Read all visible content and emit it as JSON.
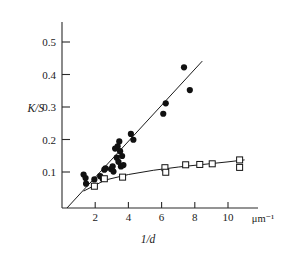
{
  "chart_data": {
    "type": "scatter",
    "title": "",
    "subtitle": "",
    "xlabel": "1/d",
    "ylabel": "K/S",
    "x_unit": "μm⁻¹",
    "xlim": [
      0,
      11.6
    ],
    "ylim": [
      0,
      0.56
    ],
    "grid": false,
    "legend_position": "none",
    "x_ticks": [
      2,
      4,
      6,
      8,
      10
    ],
    "x_tick_labels": [
      "2",
      "4",
      "6",
      "8",
      "10"
    ],
    "y_ticks": [
      0.1,
      0.2,
      0.3,
      0.4,
      0.5
    ],
    "y_tick_labels": [
      "0.1",
      "0.2",
      "0.3",
      "0.4",
      "0.5"
    ],
    "series": [
      {
        "name": "filled-circles",
        "marker": "circle-filled",
        "color": "#111111",
        "points": [
          [
            1.3,
            0.103
          ],
          [
            1.42,
            0.092
          ],
          [
            1.45,
            0.075
          ],
          [
            1.95,
            0.088
          ],
          [
            2.3,
            0.098
          ],
          [
            2.45,
            0.09
          ],
          [
            2.55,
            0.118
          ],
          [
            2.62,
            0.122
          ],
          [
            2.95,
            0.12
          ],
          [
            3.05,
            0.128
          ],
          [
            3.1,
            0.112
          ],
          [
            3.2,
            0.183
          ],
          [
            3.3,
            0.155
          ],
          [
            3.35,
            0.19
          ],
          [
            3.4,
            0.142
          ],
          [
            3.45,
            0.205
          ],
          [
            3.5,
            0.175
          ],
          [
            3.55,
            0.128
          ],
          [
            3.62,
            0.16
          ],
          [
            3.7,
            0.132
          ],
          [
            4.15,
            0.228
          ],
          [
            4.3,
            0.21
          ],
          [
            6.1,
            0.29
          ],
          [
            6.25,
            0.322
          ],
          [
            7.35,
            0.433
          ],
          [
            7.7,
            0.363
          ]
        ],
        "fit": {
          "type": "linear",
          "x0": 0.3,
          "y0": 0.0,
          "x1": 8.45,
          "y1": 0.452
        }
      },
      {
        "name": "open-squares",
        "marker": "square-open",
        "color": "#111111",
        "points": [
          [
            1.95,
            0.067
          ],
          [
            2.55,
            0.09
          ],
          [
            3.65,
            0.095
          ],
          [
            6.2,
            0.124
          ],
          [
            6.25,
            0.11
          ],
          [
            7.45,
            0.133
          ],
          [
            8.3,
            0.134
          ],
          [
            9.05,
            0.136
          ],
          [
            10.7,
            0.148
          ],
          [
            10.7,
            0.125
          ]
        ],
        "fit": {
          "type": "curve",
          "path_points": [
            [
              1.3,
              0.052
            ],
            [
              2.6,
              0.086
            ],
            [
              4.0,
              0.103
            ],
            [
              5.5,
              0.116
            ],
            [
              7.0,
              0.126
            ],
            [
              8.5,
              0.134
            ],
            [
              10.0,
              0.142
            ],
            [
              11.0,
              0.148
            ]
          ]
        }
      }
    ]
  },
  "axes": {
    "y_axis_name": "K/S",
    "x_axis_name": "1/d",
    "x_axis_unit": "μm⁻¹"
  }
}
